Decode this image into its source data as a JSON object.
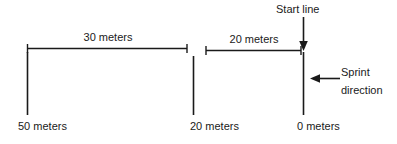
{
  "diagram": {
    "stroke_color": "#1a1a1a",
    "text_color": "#1a1a1a",
    "background_color": "#ffffff",
    "annotations": {
      "start_line": "Start line",
      "sprint_word": "Sprint",
      "direction_word": "direction"
    },
    "dimensions": [
      {
        "label": "30 meters",
        "value": 30,
        "unit": "meters",
        "from": "50 meters",
        "to": "20 meters"
      },
      {
        "label": "20 meters",
        "value": 20,
        "unit": "meters",
        "from": "20 meters",
        "to": "0 meters"
      }
    ],
    "markers": [
      {
        "label": "50 meters",
        "value": 50,
        "unit": "meters"
      },
      {
        "label": "20 meters",
        "value": 20,
        "unit": "meters"
      },
      {
        "label": "0 meters",
        "value": 0,
        "unit": "meters"
      }
    ]
  }
}
